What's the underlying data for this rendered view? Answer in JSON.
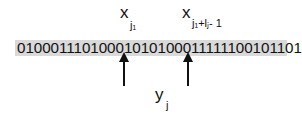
{
  "bit_string": "01000111010001010100011111100101101",
  "labels": {
    "x_start": {
      "base": "x",
      "subscript": "j₁"
    },
    "x_end": {
      "base": "x",
      "subscript": "j₁+lⱼ- 1"
    },
    "y": {
      "base": "y",
      "subscript": "j"
    }
  },
  "colors": {
    "strip": "#d9d9d9",
    "arrow": "#111111"
  }
}
